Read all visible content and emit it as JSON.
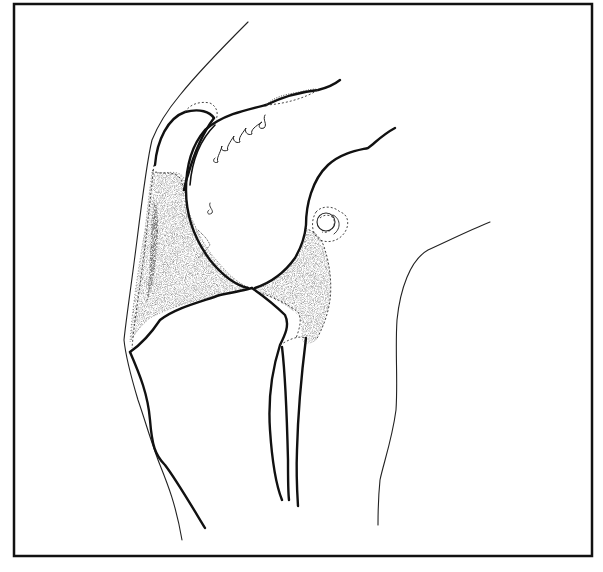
{
  "figure": {
    "colors": {
      "line": "#111111",
      "background": "#ffffff",
      "stipple": "#555555"
    },
    "parts": [
      {
        "id": "skin-anterior",
        "label": "anterior skin outline"
      },
      {
        "id": "patella",
        "label": "patella"
      },
      {
        "id": "femur",
        "label": "femoral condyle"
      },
      {
        "id": "tibia",
        "label": "tibia"
      },
      {
        "id": "fibula",
        "label": "fibula"
      },
      {
        "id": "fat-pad",
        "label": "infrapatellar fat pad (stippled)"
      },
      {
        "id": "posterior-capsule",
        "label": "posterior stippled region"
      },
      {
        "id": "vessel",
        "label": "popliteal vessel cross-section"
      },
      {
        "id": "skin-posterior",
        "label": "posterior skin outline"
      }
    ]
  }
}
